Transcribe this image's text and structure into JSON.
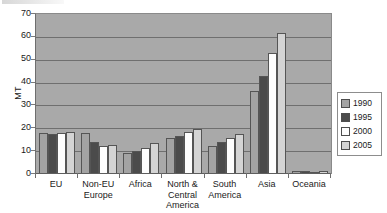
{
  "chart_data": {
    "type": "bar",
    "title": "",
    "subtitle": "",
    "xlabel": "",
    "ylabel": "MT",
    "ylim": [
      0,
      70
    ],
    "ytick_step": 10,
    "yticks": [
      70,
      60,
      50,
      40,
      30,
      20,
      10,
      0
    ],
    "grid": true,
    "legend_position": "right",
    "plot_background": "#a9a9a9",
    "categories": [
      "EU",
      "Non-EU Europe",
      "Africa",
      "North & Central America",
      "South America",
      "Asia",
      "Oceania"
    ],
    "category_label_lines": [
      [
        "EU"
      ],
      [
        "Non-EU",
        "Europe"
      ],
      [
        "Africa"
      ],
      [
        "North &",
        "Central",
        "America"
      ],
      [
        "South",
        "America"
      ],
      [
        "Asia"
      ],
      [
        "Oceania"
      ]
    ],
    "series": [
      {
        "name": "1990",
        "color": "#a3a3a3",
        "values": [
          17.9,
          17.8,
          9.0,
          15.7,
          12.3,
          36.5,
          1.2
        ]
      },
      {
        "name": "1995",
        "color": "#4b4b4b",
        "values": [
          17.3,
          14.0,
          10.2,
          16.8,
          14.0,
          43.0,
          1.5
        ]
      },
      {
        "name": "2000",
        "color": "#fdfdfd",
        "values": [
          18.0,
          12.2,
          11.4,
          18.5,
          15.6,
          53.1,
          1.1
        ]
      },
      {
        "name": "2005",
        "color": "#d4d4d4",
        "values": [
          18.6,
          12.7,
          13.5,
          19.5,
          17.5,
          61.5,
          1.4
        ]
      }
    ]
  },
  "legend": {
    "entries": [
      {
        "label": "1990"
      },
      {
        "label": "1995"
      },
      {
        "label": "2000"
      },
      {
        "label": "2005"
      }
    ]
  }
}
